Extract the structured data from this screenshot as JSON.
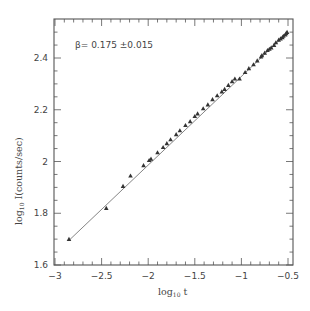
{
  "chart_data": {
    "type": "scatter",
    "title": "",
    "xlabel": "log10 t",
    "ylabel": "log10 I(counts/sec)",
    "xlim": [
      -3,
      -0.5
    ],
    "ylim": [
      1.6,
      2.52
    ],
    "xticks": [
      -3,
      -2.5,
      -2,
      -1.5,
      -1,
      -0.5
    ],
    "xtick_labels": [
      "-3",
      "-2.5",
      "-2",
      "-1.5",
      "-1",
      "-0.5"
    ],
    "yticks": [
      1.6,
      1.8,
      2.0,
      2.2,
      2.4
    ],
    "ytick_labels": [
      "1.6",
      "1.8",
      "2",
      "2.2",
      "2.4"
    ],
    "grid": false,
    "legend": null,
    "annotation": "β= 0.175 ±0.015",
    "marker": "triangle",
    "fit_line": {
      "x": [
        -2.85,
        -0.5
      ],
      "y": [
        1.695,
        2.5
      ]
    },
    "series": [
      {
        "name": "data",
        "x": [
          -2.85,
          -2.45,
          -2.27,
          -2.19,
          -2.05,
          -1.99,
          -1.97,
          -1.9,
          -1.84,
          -1.8,
          -1.76,
          -1.7,
          -1.66,
          -1.6,
          -1.55,
          -1.5,
          -1.47,
          -1.41,
          -1.36,
          -1.31,
          -1.26,
          -1.21,
          -1.18,
          -1.14,
          -1.1,
          -1.07,
          -1.02,
          -0.96,
          -0.92,
          -0.87,
          -0.83,
          -0.79,
          -0.78,
          -0.75,
          -0.72,
          -0.7,
          -0.68,
          -0.65,
          -0.63,
          -0.6,
          -0.58,
          -0.56,
          -0.55,
          -0.53,
          -0.52,
          -0.51
        ],
        "y": [
          1.7,
          1.82,
          1.905,
          1.945,
          1.985,
          2.005,
          2.01,
          2.035,
          2.055,
          2.07,
          2.085,
          2.105,
          2.12,
          2.14,
          2.155,
          2.175,
          2.185,
          2.205,
          2.22,
          2.24,
          2.255,
          2.27,
          2.28,
          2.295,
          2.31,
          2.32,
          2.32,
          2.345,
          2.36,
          2.375,
          2.39,
          2.405,
          2.41,
          2.42,
          2.43,
          2.435,
          2.44,
          2.45,
          2.46,
          2.47,
          2.475,
          2.48,
          2.485,
          2.49,
          2.495,
          2.5
        ]
      }
    ]
  },
  "axes": {
    "xlabel_main": "log",
    "xlabel_sub": "10",
    "xlabel_var": " t",
    "ylabel_main": "log",
    "ylabel_sub": "10",
    "ylabel_var": " I(counts/sec)"
  },
  "annotation_text": "β= 0.175 ±0.015"
}
